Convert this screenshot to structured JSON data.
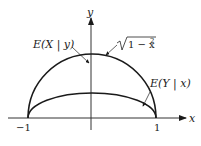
{
  "diagram": {
    "axes": {
      "x_label": "x",
      "y_label": "y",
      "ticks": [
        {
          "label": "−1",
          "value": -1
        },
        {
          "label": "1",
          "value": 1
        }
      ]
    },
    "curves": [
      {
        "name": "semicircle",
        "label": "√1 − x²",
        "label_radicand": "1 − x",
        "label_exp": "2",
        "equation": "y = sqrt(1 - x^2)"
      },
      {
        "name": "E(X|y)",
        "label": "E(X | y)",
        "description": "points to semicircle region near y-axis"
      },
      {
        "name": "E(Y|x)",
        "label": "E(Y | x)",
        "description": "lower arc, y = 0.5*sqrt(1 - x^2)"
      }
    ],
    "colors": {
      "stroke": "#1a1a1a",
      "background": "#ffffff"
    }
  }
}
